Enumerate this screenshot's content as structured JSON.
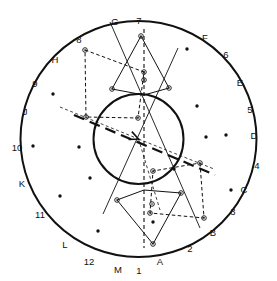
{
  "figure": {
    "name": "circular-scatter-polygon-diagram",
    "width": 277,
    "height": 281,
    "background": "#ffffff",
    "stroke_color": "#111111",
    "center": {
      "x": 138.5,
      "y": 139.0
    },
    "outer_circle": {
      "cx": 138.5,
      "cy": 139.0,
      "r": 118.0,
      "stroke_width": 2.0
    },
    "inner_circle": {
      "cx": 138.5,
      "cy": 139.0,
      "r": 45.0,
      "stroke_width": 2.0
    }
  },
  "rim_labels": {
    "letters": [
      {
        "text": "A",
        "angle_deg": 105,
        "x": 160,
        "y": 262
      },
      {
        "text": "B",
        "angle_deg": 75,
        "x": 213,
        "y": 233
      },
      {
        "text": "C",
        "angle_deg": 45,
        "x": 244,
        "y": 190
      },
      {
        "text": "D",
        "angle_deg": 15,
        "x": 254,
        "y": 136
      },
      {
        "text": "E",
        "angle_deg": 345,
        "x": 240,
        "y": 83
      },
      {
        "text": "F",
        "angle_deg": 315,
        "x": 205,
        "y": 38
      },
      {
        "text": "G",
        "angle_deg": 285,
        "x": 115,
        "y": 22
      },
      {
        "text": "H",
        "angle_deg": 255,
        "x": 55,
        "y": 60
      },
      {
        "text": "J",
        "angle_deg": 225,
        "x": 25,
        "y": 112
      },
      {
        "text": "K",
        "angle_deg": 195,
        "x": 22,
        "y": 184
      },
      {
        "text": "L",
        "angle_deg": 165,
        "x": 65,
        "y": 245
      },
      {
        "text": "M",
        "angle_deg": 135,
        "x": 118,
        "y": 270
      }
    ],
    "numbers": [
      {
        "text": "1",
        "angle_deg": 90,
        "x": 139,
        "y": 271
      },
      {
        "text": "2",
        "angle_deg": 60,
        "x": 190,
        "y": 249
      },
      {
        "text": "3",
        "angle_deg": 30,
        "x": 233,
        "y": 212
      },
      {
        "text": "4",
        "angle_deg": 0,
        "x": 257,
        "y": 166
      },
      {
        "text": "5",
        "angle_deg": 330,
        "x": 250,
        "y": 110
      },
      {
        "text": "6",
        "angle_deg": 300,
        "x": 226,
        "y": 55
      },
      {
        "text": "7",
        "angle_deg": 270,
        "x": 139,
        "y": 21
      },
      {
        "text": "8",
        "angle_deg": 240,
        "x": 79,
        "y": 40
      },
      {
        "text": "9",
        "angle_deg": 210,
        "x": 35,
        "y": 84
      },
      {
        "text": "10",
        "angle_deg": 180,
        "x": 17,
        "y": 148
      },
      {
        "text": "11",
        "angle_deg": 150,
        "x": 40,
        "y": 215
      },
      {
        "text": "12",
        "angle_deg": 120,
        "x": 89,
        "y": 262
      }
    ]
  },
  "scatter_points": [
    {
      "x": 53,
      "y": 94
    },
    {
      "x": 33,
      "y": 146
    },
    {
      "x": 79,
      "y": 147
    },
    {
      "x": 60,
      "y": 196
    },
    {
      "x": 98,
      "y": 231
    },
    {
      "x": 90,
      "y": 178
    },
    {
      "x": 187,
      "y": 49
    },
    {
      "x": 197,
      "y": 106
    },
    {
      "x": 206,
      "y": 137
    },
    {
      "x": 226,
      "y": 135
    },
    {
      "x": 231,
      "y": 190
    },
    {
      "x": 174,
      "y": 169
    },
    {
      "x": 153,
      "y": 222
    }
  ],
  "upper_polygon": {
    "name": "upper-kite-polygon",
    "closed": true,
    "vertices": [
      {
        "x": 141,
        "y": 36
      },
      {
        "x": 169,
        "y": 88
      },
      {
        "x": 144,
        "y": 95
      },
      {
        "x": 112,
        "y": 89
      }
    ],
    "marked_vertices": [
      {
        "x": 141,
        "y": 36
      },
      {
        "x": 169,
        "y": 88
      },
      {
        "x": 144,
        "y": 80
      },
      {
        "x": 112,
        "y": 89
      }
    ]
  },
  "lower_polygon": {
    "name": "lower-kite-polygon",
    "closed": true,
    "vertices": [
      {
        "x": 153,
        "y": 244
      },
      {
        "x": 117,
        "y": 200
      },
      {
        "x": 144,
        "y": 190
      },
      {
        "x": 181,
        "y": 193
      }
    ],
    "marked_vertices": [
      {
        "x": 153,
        "y": 244
      },
      {
        "x": 117,
        "y": 200
      },
      {
        "x": 152,
        "y": 204
      },
      {
        "x": 181,
        "y": 193
      }
    ]
  },
  "dashed_quad_upper": {
    "name": "upper-left-dashed-quadrilateral",
    "vertices": [
      {
        "x": 85,
        "y": 50
      },
      {
        "x": 144,
        "y": 72
      },
      {
        "x": 138,
        "y": 118
      },
      {
        "x": 86,
        "y": 117
      }
    ]
  },
  "dashed_quad_lower": {
    "name": "lower-right-dashed-quadrilateral",
    "vertices": [
      {
        "x": 200,
        "y": 163
      },
      {
        "x": 204,
        "y": 218
      },
      {
        "x": 150,
        "y": 213
      },
      {
        "x": 153,
        "y": 171
      }
    ]
  },
  "cross_lines": [
    {
      "name": "line-G-to-lower-right",
      "x1": 110,
      "y1": 22,
      "x2": 200,
      "y2": 228
    },
    {
      "name": "line-upper-right-to-lower-left",
      "x1": 178,
      "y1": 48,
      "x2": 103,
      "y2": 214
    }
  ],
  "vertical_dashed_axis": {
    "x": 144,
    "y1": 29,
    "y2": 248
  },
  "arrow": {
    "name": "center-arrow",
    "x1": 74,
    "y1": 115,
    "x2": 215,
    "y2": 175,
    "head_x": 138.5,
    "head_y": 139.0,
    "style": "long-dash",
    "stroke_width": 2.2
  },
  "thin_dashed_radials": [
    {
      "name": "radial-dashed-upper-left",
      "x1": 60,
      "y1": 107,
      "x2": 138.5,
      "y2": 139
    },
    {
      "name": "radial-dashed-lower-right",
      "x1": 138.5,
      "y1": 139,
      "x2": 214,
      "y2": 169
    },
    {
      "name": "radial-dashed-lower",
      "x1": 138.5,
      "y1": 139,
      "x2": 160,
      "y2": 210
    }
  ],
  "marker_style": {
    "outer_r": 2.3,
    "inner_r": 0.8,
    "fill": "#111111"
  }
}
